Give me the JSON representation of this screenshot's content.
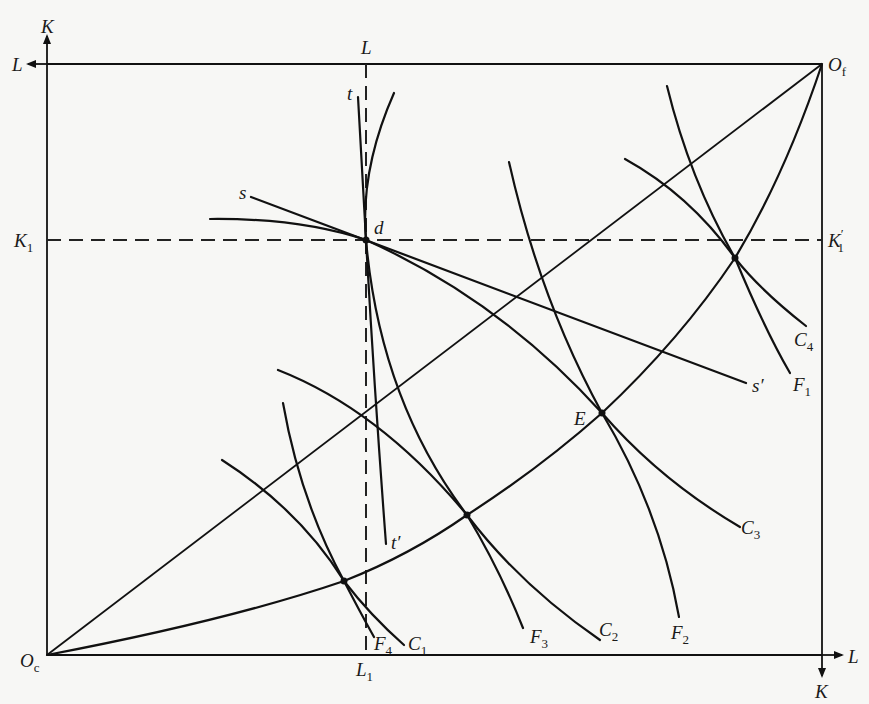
{
  "diagram": {
    "origins": {
      "clothing": {
        "label": "O",
        "subscript": "c"
      },
      "food": {
        "label": "O",
        "subscript": "f"
      }
    },
    "axes": {
      "clothing_vertical": "K",
      "clothing_horizontal": "L",
      "food_horizontal": "L",
      "food_vertical": "K",
      "top_dashed_label": "L"
    },
    "reference_lines": {
      "K1": {
        "label": "K",
        "subscript": "1"
      },
      "K1_prime": {
        "label": "K",
        "subscript": "1",
        "prime": "′"
      },
      "L1": {
        "label": "L",
        "subscript": "1"
      }
    },
    "points": {
      "d": "d",
      "E": "E"
    },
    "tangent_labels": {
      "s": "s",
      "s_prime": "s′",
      "t": "t",
      "t_prime": "t′"
    },
    "clothing_isoquants": [
      {
        "label": "C",
        "subscript": "1"
      },
      {
        "label": "C",
        "subscript": "2"
      },
      {
        "label": "C",
        "subscript": "3"
      },
      {
        "label": "C",
        "subscript": "4"
      }
    ],
    "food_isoquants": [
      {
        "label": "F",
        "subscript": "1"
      },
      {
        "label": "F",
        "subscript": "2"
      },
      {
        "label": "F",
        "subscript": "3"
      },
      {
        "label": "F",
        "subscript": "4"
      }
    ]
  },
  "colors": {
    "background": "#f7f7f5",
    "ink": "#111111"
  }
}
